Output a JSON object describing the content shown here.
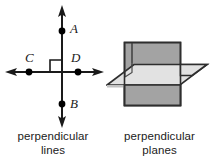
{
  "figures": [
    {
      "id": "perpendicular-lines",
      "caption_line1": "perpendicular",
      "caption_line2": "lines",
      "point_labels": [
        "A",
        "C",
        "D",
        "B"
      ],
      "colors": {
        "line": "#1a1a1a",
        "point": "#000000",
        "label": "#212121",
        "right_angle_mark": "#1a1a1a"
      }
    },
    {
      "id": "perpendicular-planes",
      "caption_line1": "perpendicular",
      "caption_line2": "planes",
      "colors": {
        "vertical_plane_fill": "#a3a3a3",
        "horizontal_plane_fill": "#e2e2e2",
        "horizontal_plane_shadow": "#c2c2c2",
        "outline": "#2e2e2e"
      }
    }
  ]
}
